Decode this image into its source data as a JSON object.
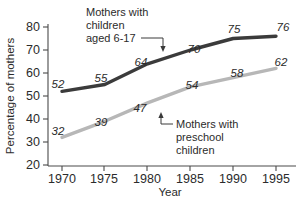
{
  "chart_data": {
    "type": "line",
    "title": "",
    "xlabel": "Year",
    "ylabel": "Percentage of mothers",
    "x": [
      1970,
      1975,
      1980,
      1985,
      1990,
      1995
    ],
    "xticklabels": [
      "1970",
      "1975",
      "1980",
      "1985",
      "1990",
      "1995"
    ],
    "yticks": [
      20,
      30,
      40,
      50,
      60,
      70,
      80
    ],
    "yticklabels": [
      "20",
      "30",
      "40",
      "50",
      "60",
      "70",
      "80"
    ],
    "ylim": [
      20,
      80
    ],
    "xlim": [
      1968,
      1997
    ],
    "grid": false,
    "legend_position": "inline-annotations",
    "series": [
      {
        "name": "Mothers with children aged 6-17",
        "color": "#3b3b3b",
        "values": [
          52,
          55,
          64,
          70,
          75,
          76
        ],
        "labels": [
          "52",
          "55",
          "64",
          "70",
          "75",
          "76"
        ]
      },
      {
        "name": "Mothers with preschool children",
        "color": "#b7b7b7",
        "values": [
          32,
          39,
          47,
          54,
          58,
          62
        ],
        "labels": [
          "32",
          "39",
          "47",
          "54",
          "58",
          "62"
        ]
      }
    ],
    "annotations": [
      {
        "id": "upper",
        "lines": [
          "Mothers with",
          "children",
          "aged 6-17"
        ]
      },
      {
        "id": "lower",
        "lines": [
          "Mothers with",
          "preschool",
          "children"
        ]
      }
    ]
  }
}
